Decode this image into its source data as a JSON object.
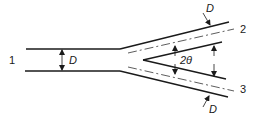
{
  "diagram": {
    "type": "pipe-bifurcation",
    "branches": [
      {
        "id": "1",
        "label": "1",
        "role": "inlet"
      },
      {
        "id": "2",
        "label": "2",
        "role": "outlet-upper"
      },
      {
        "id": "3",
        "label": "3",
        "role": "outlet-lower"
      }
    ],
    "dimensions": {
      "inlet_diameter": "D",
      "upper_branch_diameter": "D",
      "lower_branch_diameter": "D",
      "branch_angle": "2θ"
    },
    "colors": {
      "line": "#1a1a1a",
      "background": "#ffffff"
    }
  }
}
